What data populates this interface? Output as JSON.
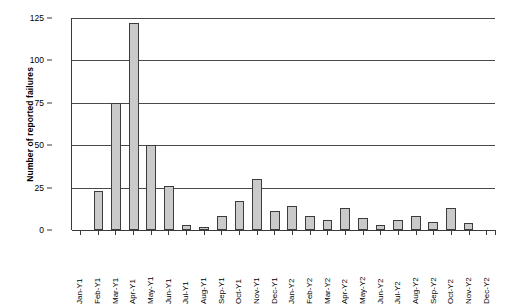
{
  "chart_data": {
    "type": "bar",
    "title": "",
    "xlabel": "",
    "ylabel": "Number of reported failures",
    "ylim": [
      0,
      125
    ],
    "yticks": [
      0,
      25,
      50,
      75,
      100,
      125
    ],
    "grid": true,
    "legend": false,
    "categories": [
      "Jan-Y1",
      "Feb-Y1",
      "Mar-Y1",
      "Apr-Y1",
      "May-Y1",
      "Jun-Y1",
      "Jul-Y1",
      "Aug-Y1",
      "Sep-Y1",
      "Oct-Y1",
      "Nov-Y1",
      "Dec-Y1",
      "Jan-Y2",
      "Feb-Y2",
      "Mar-Y2",
      "Apr-Y2",
      "May-Y2",
      "Jun-Y2",
      "Jul-Y2",
      "Aug-Y2",
      "Sep-Y2",
      "Oct-Y2",
      "Nov-Y2",
      "Dec-Y2"
    ],
    "values": [
      0,
      23,
      75,
      122,
      50,
      26,
      3,
      2,
      8,
      17,
      30,
      11,
      14,
      8,
      6,
      13,
      7,
      3,
      6,
      8,
      5,
      13,
      4,
      0
    ],
    "series": [
      {
        "name": "Reported failures",
        "values": [
          0,
          23,
          75,
          122,
          50,
          26,
          3,
          2,
          8,
          17,
          30,
          11,
          14,
          8,
          6,
          13,
          7,
          3,
          6,
          8,
          5,
          13,
          4,
          0
        ]
      }
    ],
    "colors": {
      "bar_fill": "#cacaca",
      "bar_border": "#3c3c3c",
      "axis": "#3a3a3a",
      "gridline": "#4a4a4a",
      "background": "#ffffff"
    }
  }
}
